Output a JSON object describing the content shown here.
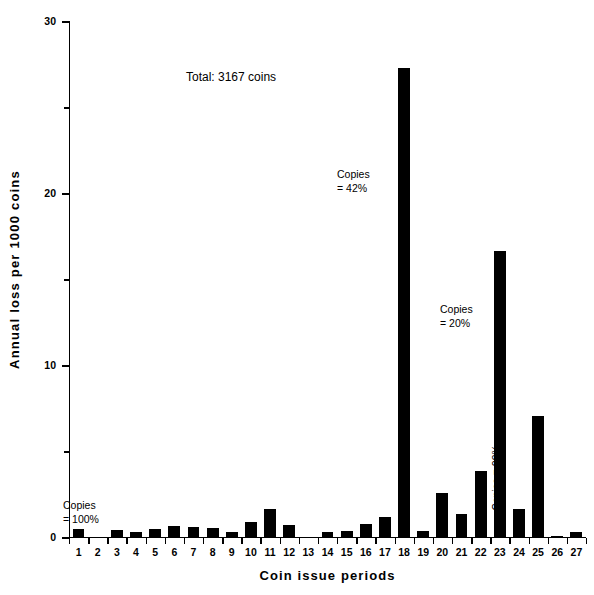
{
  "chart_data": {
    "type": "bar",
    "title": "",
    "xlabel": "Coin issue periods",
    "ylabel": "Annual loss per 1000 coins",
    "categories": [
      "1",
      "2",
      "3",
      "4",
      "5",
      "6",
      "7",
      "8",
      "9",
      "10",
      "11",
      "12",
      "13",
      "14",
      "15",
      "16",
      "17",
      "18",
      "19",
      "20",
      "21",
      "22",
      "23",
      "24",
      "25",
      "26",
      "27"
    ],
    "values": [
      0.5,
      0.0,
      0.45,
      0.35,
      0.55,
      0.7,
      0.65,
      0.6,
      0.35,
      0.95,
      1.7,
      0.75,
      0.05,
      0.35,
      0.4,
      0.8,
      1.2,
      27.3,
      0.4,
      2.6,
      1.4,
      3.9,
      16.7,
      1.7,
      7.1,
      0.1,
      0.35
    ],
    "ylim": [
      0,
      30
    ],
    "yticks": [
      0,
      10,
      20,
      30
    ],
    "ytick_labels": [
      "0",
      "10",
      "20",
      "30"
    ],
    "yticks_minor": [
      5,
      15,
      25
    ],
    "grid": false,
    "legend": "none",
    "bar_color": "#000000",
    "annotations": [
      {
        "id": "total",
        "text": "Total:  3167 coins"
      },
      {
        "id": "copies-100",
        "line1": "Copies",
        "line2": "= 100%",
        "refers_to_category": "1"
      },
      {
        "id": "copies-42",
        "line1": "Copies",
        "line2": "= 42%",
        "refers_to_category": "18"
      },
      {
        "id": "copies-20",
        "line1": "Copies",
        "line2": "= 20%",
        "refers_to_category": "23"
      },
      {
        "id": "copies-29",
        "text": "Copies = 29%",
        "refers_to_category": "24",
        "orientation": "vertical"
      }
    ]
  }
}
